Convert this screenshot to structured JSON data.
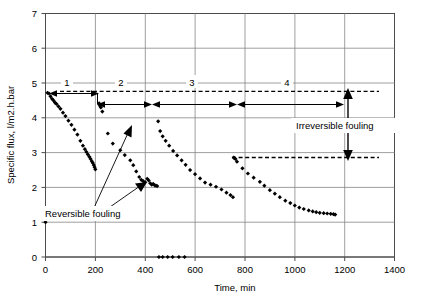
{
  "chart_data": {
    "type": "scatter",
    "title": "",
    "xlabel": "Time, min",
    "ylabel": "Specific flux, l/m2.h.bar",
    "xlim": [
      0,
      1400
    ],
    "ylim": [
      0,
      7
    ],
    "xticks": [
      0,
      200,
      400,
      600,
      800,
      1000,
      1200,
      1400
    ],
    "yticks": [
      0,
      1,
      2,
      3,
      4,
      5,
      6,
      7
    ],
    "grid": true,
    "legend": "none",
    "series": [
      {
        "name": "Specific flux",
        "marker": "diamond",
        "color": "#000000",
        "points": [
          [
            0,
            1.0
          ],
          [
            8,
            4.72
          ],
          [
            14,
            4.7
          ],
          [
            20,
            4.62
          ],
          [
            26,
            4.55
          ],
          [
            32,
            4.5
          ],
          [
            38,
            4.44
          ],
          [
            44,
            4.4
          ],
          [
            52,
            4.33
          ],
          [
            60,
            4.26
          ],
          [
            70,
            4.15
          ],
          [
            80,
            4.05
          ],
          [
            92,
            3.92
          ],
          [
            104,
            3.8
          ],
          [
            116,
            3.66
          ],
          [
            128,
            3.52
          ],
          [
            140,
            3.34
          ],
          [
            150,
            3.2
          ],
          [
            158,
            3.1
          ],
          [
            164,
            3.02
          ],
          [
            170,
            2.95
          ],
          [
            176,
            2.88
          ],
          [
            181,
            2.82
          ],
          [
            186,
            2.75
          ],
          [
            190,
            2.7
          ],
          [
            194,
            2.64
          ],
          [
            197,
            2.58
          ],
          [
            200,
            2.52
          ],
          [
            215,
            4.42
          ],
          [
            218,
            4.35
          ],
          [
            222,
            4.3
          ],
          [
            228,
            4.18
          ],
          [
            250,
            3.55
          ],
          [
            270,
            3.26
          ],
          [
            300,
            3.07
          ],
          [
            318,
            2.93
          ],
          [
            340,
            2.78
          ],
          [
            352,
            2.64
          ],
          [
            364,
            2.46
          ],
          [
            376,
            2.3
          ],
          [
            384,
            2.22
          ],
          [
            392,
            2.18
          ],
          [
            400,
            2.15
          ],
          [
            408,
            2.25
          ],
          [
            414,
            2.2
          ],
          [
            420,
            2.12
          ],
          [
            426,
            2.08
          ],
          [
            432,
            2.1
          ],
          [
            438,
            2.06
          ],
          [
            443,
            2.05
          ],
          [
            448,
            2.04
          ],
          [
            455,
            0.0
          ],
          [
            470,
            0.0
          ],
          [
            490,
            0.0
          ],
          [
            510,
            0.0
          ],
          [
            535,
            0.0
          ],
          [
            558,
            0.0
          ],
          [
            452,
            3.9
          ],
          [
            460,
            3.62
          ],
          [
            470,
            3.47
          ],
          [
            482,
            3.34
          ],
          [
            496,
            3.2
          ],
          [
            512,
            3.05
          ],
          [
            528,
            2.92
          ],
          [
            546,
            2.78
          ],
          [
            562,
            2.65
          ],
          [
            580,
            2.5
          ],
          [
            600,
            2.38
          ],
          [
            620,
            2.26
          ],
          [
            640,
            2.14
          ],
          [
            662,
            2.08
          ],
          [
            684,
            2.02
          ],
          [
            706,
            1.94
          ],
          [
            726,
            1.85
          ],
          [
            742,
            1.78
          ],
          [
            752,
            1.72
          ],
          [
            755,
            2.86
          ],
          [
            758,
            2.84
          ],
          [
            762,
            2.82
          ],
          [
            768,
            2.74
          ],
          [
            790,
            2.55
          ],
          [
            812,
            2.4
          ],
          [
            835,
            2.28
          ],
          [
            860,
            2.16
          ],
          [
            878,
            2.05
          ],
          [
            900,
            1.92
          ],
          [
            920,
            1.82
          ],
          [
            940,
            1.72
          ],
          [
            962,
            1.62
          ],
          [
            982,
            1.55
          ],
          [
            1000,
            1.48
          ],
          [
            1018,
            1.42
          ],
          [
            1036,
            1.38
          ],
          [
            1056,
            1.34
          ],
          [
            1072,
            1.31
          ],
          [
            1086,
            1.29
          ],
          [
            1100,
            1.27
          ],
          [
            1116,
            1.26
          ],
          [
            1130,
            1.25
          ],
          [
            1144,
            1.24
          ],
          [
            1155,
            1.23
          ],
          [
            1162,
            1.22
          ]
        ]
      }
    ],
    "reference_lines": [
      {
        "name": "initial-flux-dashed",
        "y": 4.75,
        "x_from": 60,
        "x_to": 1340,
        "style": "dashed"
      },
      {
        "name": "final-flux-dashed",
        "y": 2.86,
        "x_from": 750,
        "x_to": 1340,
        "style": "dashed"
      }
    ],
    "phase_markers": [
      {
        "label": "1",
        "x_from": 20,
        "x_to": 200,
        "y": 4.7
      },
      {
        "label": "2",
        "x_from": 210,
        "x_to": 450,
        "y": 4.38
      },
      {
        "label": "3",
        "x_from": 455,
        "x_to": 750,
        "y": 4.38
      },
      {
        "label": "4",
        "x_from": 758,
        "x_to": 1200,
        "y": 4.38
      }
    ],
    "annotations": [
      {
        "label": "Reversible fouling",
        "x": 300,
        "y": 1.55
      },
      {
        "label": "Irreversible fouling",
        "x": 1130,
        "y": 3.55
      }
    ]
  },
  "axes": {
    "x_title": "Time, min",
    "y_title": "Specific flux, l/m2.h.bar",
    "x_tick_labels": [
      "0",
      "200",
      "400",
      "600",
      "800",
      "1000",
      "1200",
      "1400"
    ],
    "y_tick_labels": [
      "0",
      "1",
      "2",
      "3",
      "4",
      "5",
      "6",
      "7"
    ]
  },
  "phases": {
    "one": "1",
    "two": "2",
    "three": "3",
    "four": "4"
  },
  "labels": {
    "reversible_fouling": "Reversible fouling",
    "irreversible_fouling": "Irreversible fouling"
  },
  "colors": {
    "marker": "#000000",
    "grid": "#868686",
    "frame": "#4d4d4d",
    "background": "#ffffff"
  }
}
